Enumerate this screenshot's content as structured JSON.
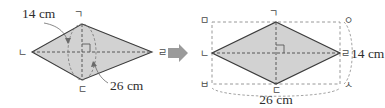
{
  "figure": {
    "title_absent": true,
    "transform_arrow": "right-arrow-icon",
    "arrow_color": "#9a9a9a",
    "shape_fill": "#d2d2d2",
    "shape_stroke": "#3c3c3c",
    "dash_color": "#8c8c8c"
  },
  "left_figure": {
    "name": "rhombus-with-diagonals",
    "vertices": {
      "top": "ㄱ",
      "left": "ㄴ",
      "bottom": "ㄷ",
      "right": "ㄹ"
    },
    "dimensions": {
      "vertical_diagonal": "14 cm",
      "horizontal_diagonal": "26 cm"
    }
  },
  "right_figure": {
    "name": "rhombus-in-bounding-rectangle",
    "rhombus_vertices": {
      "top": "ㄱ",
      "left": "ㄴ",
      "bottom": "ㄷ",
      "right": "ㄹ"
    },
    "rectangle_corners": {
      "top_left": "ㅁ",
      "top_right": "ㅇ",
      "bottom_left": "ㅂ",
      "bottom_right": "ㅅ"
    },
    "dimensions": {
      "height": "14 cm",
      "width": "26 cm"
    }
  }
}
